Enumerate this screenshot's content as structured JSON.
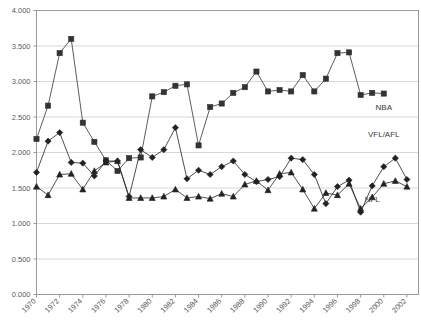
{
  "chart_data": {
    "type": "line",
    "title": "",
    "subtitle": "",
    "xlabel": "",
    "ylabel": "",
    "xlim": [
      1970,
      2003
    ],
    "ylim": [
      0.0,
      4.0
    ],
    "grid": true,
    "legend_position": "inline-right",
    "y_ticks": [
      "0.000",
      "0.500",
      "1.000",
      "1.500",
      "2.000",
      "2.500",
      "3.000",
      "3.500",
      "4.000"
    ],
    "y_tick_values": [
      0.0,
      0.5,
      1.0,
      1.5,
      2.0,
      2.5,
      3.0,
      3.5,
      4.0
    ],
    "x_ticks": [
      "1970",
      "1972",
      "1974",
      "1976",
      "1978",
      "1980",
      "1982",
      "1984",
      "1986",
      "1988",
      "1990",
      "1992",
      "1994",
      "1996",
      "1998",
      "2000",
      "2002"
    ],
    "x_tick_values": [
      1970,
      1972,
      1974,
      1976,
      1978,
      1980,
      1982,
      1984,
      1986,
      1988,
      1990,
      1992,
      1994,
      1996,
      1998,
      2000,
      2002
    ],
    "x": [
      1970,
      1971,
      1972,
      1973,
      1974,
      1975,
      1976,
      1977,
      1978,
      1979,
      1980,
      1981,
      1982,
      1983,
      1984,
      1985,
      1986,
      1987,
      1988,
      1989,
      1990,
      1991,
      1992,
      1993,
      1994,
      1995,
      1996,
      1997,
      1998,
      1999,
      2000,
      2001,
      2002
    ],
    "series": [
      {
        "name": "NBA",
        "marker": "square",
        "color": "#333333",
        "label_x": 2000,
        "label_y": 2.6,
        "values": [
          2.19,
          2.66,
          3.4,
          3.6,
          2.42,
          2.15,
          1.89,
          1.74,
          1.92,
          1.93,
          2.79,
          2.85,
          2.94,
          2.96,
          2.1,
          2.64,
          2.69,
          2.84,
          2.92,
          3.14,
          2.86,
          2.88,
          2.86,
          3.09,
          2.86,
          3.04,
          3.4,
          3.41,
          2.81,
          2.84,
          2.83,
          null,
          null
        ]
      },
      {
        "name": "VFL/AFL",
        "marker": "diamond",
        "color": "#222222",
        "label_x": 2000,
        "label_y": 2.22,
        "values": [
          1.72,
          2.16,
          2.28,
          1.86,
          1.85,
          1.67,
          1.88,
          1.88,
          1.38,
          2.04,
          1.93,
          2.04,
          2.35,
          1.63,
          1.75,
          1.69,
          1.8,
          1.88,
          1.69,
          1.59,
          1.62,
          1.66,
          1.92,
          1.9,
          1.69,
          1.28,
          1.52,
          1.61,
          1.16,
          1.53,
          1.8,
          1.92,
          1.62
        ]
      },
      {
        "name": "NFL",
        "marker": "triangle",
        "color": "#222222",
        "label_x": 1999,
        "label_y": 1.3,
        "values": [
          1.52,
          1.4,
          1.69,
          1.7,
          1.48,
          1.74,
          1.86,
          1.88,
          1.36,
          1.36,
          1.36,
          1.38,
          1.48,
          1.36,
          1.38,
          1.35,
          1.42,
          1.38,
          1.55,
          1.6,
          1.47,
          1.7,
          1.72,
          1.48,
          1.21,
          1.43,
          1.4,
          1.56,
          1.21,
          1.37,
          1.56,
          1.6,
          1.52
        ]
      }
    ]
  },
  "axes": {
    "y_axis_name": "value-axis",
    "x_axis_name": "year-axis"
  }
}
